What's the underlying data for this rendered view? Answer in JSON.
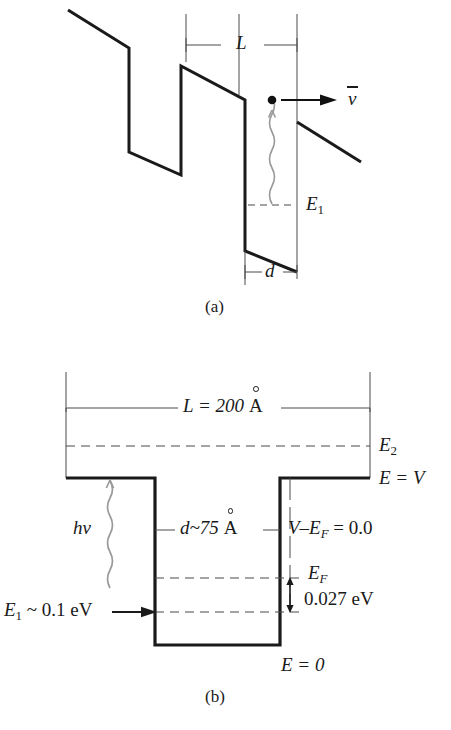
{
  "figure": {
    "panels": [
      {
        "id": "a",
        "caption": "(a)",
        "labels": {
          "width_L": "L",
          "width_d": "d",
          "level_E1": "E",
          "level_E1_sub": "1",
          "velocity": "v",
          "photon": ""
        }
      },
      {
        "id": "b",
        "caption": "(b)",
        "labels": {
          "width_L": "L  =  200",
          "width_L_unit": "A",
          "width_d": "d~75",
          "width_d_unit": "A",
          "level_E2": "E",
          "level_E2_sub": "2",
          "level_EV": "E  =  V",
          "level_V_minus_EF": "V–E",
          "level_V_minus_EF_sub": "F",
          "level_V_minus_EF_val": "  =  0.0",
          "level_EF": "E",
          "level_EF_sub": "F",
          "gap_value": "0.027  eV",
          "level_E1": "E",
          "level_E1_sub": "1",
          "level_E1_val": " ~ 0.1  eV",
          "photon": "hv",
          "level_E0": "E  =  0"
        }
      }
    ],
    "style": {
      "stroke": "#1a1a1a",
      "thin_stroke": "#4a4a4a",
      "wave_stroke": "#8c8c8c",
      "background": "#ffffff"
    }
  }
}
